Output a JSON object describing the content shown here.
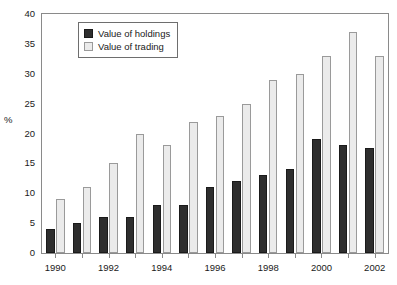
{
  "chart_data": {
    "type": "bar",
    "title": "",
    "subtitle": "",
    "xlabel": "",
    "ylabel": "%",
    "ylim": [
      0,
      40
    ],
    "ytick_step": 5,
    "yticks": [
      0,
      5,
      10,
      15,
      20,
      25,
      30,
      35,
      40
    ],
    "grid": false,
    "legend_position": "top-left-inside",
    "categories": [
      "1990",
      "1991",
      "1992",
      "1993",
      "1994",
      "1995",
      "1996",
      "1997",
      "1998",
      "1999",
      "2000",
      "2001",
      "2002"
    ],
    "xtick_labels_shown": [
      "1990",
      "1992",
      "1994",
      "1996",
      "1998",
      "2000",
      "2002"
    ],
    "series": [
      {
        "name": "Value of holdings",
        "color": "#2e2e2e",
        "values": [
          4,
          5,
          6,
          6,
          8,
          8,
          11,
          12,
          13,
          14,
          19,
          18,
          17.5
        ]
      },
      {
        "name": "Value of trading",
        "color": "#ebebeb",
        "values": [
          9,
          11,
          15,
          20,
          18,
          22,
          23,
          25,
          29,
          30,
          33,
          37,
          33
        ]
      }
    ]
  },
  "legend": {
    "items": [
      {
        "label": "Value of holdings",
        "swatch": "holdings"
      },
      {
        "label": "Value of trading",
        "swatch": "trading"
      }
    ]
  },
  "axes": {
    "y_title": "%"
  }
}
